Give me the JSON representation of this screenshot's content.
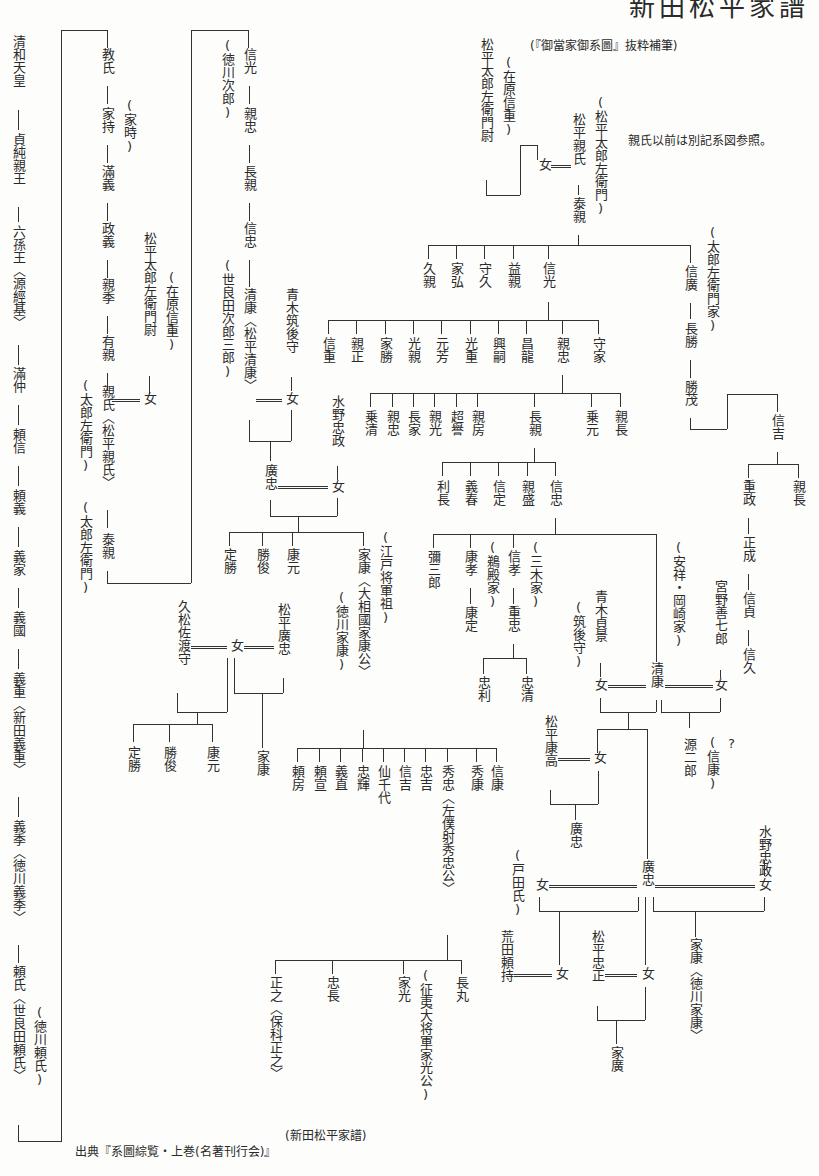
{
  "title": "新田松平家譜",
  "subtitle": "(『御當家御系圖』抜粋補筆)",
  "note": "親氏以前は別記系図参照。",
  "source": "出典『系圖綜覧・上巻(名著刊行会)』",
  "caption": "(新田松平家譜)",
  "col1": {
    "a": "清和天皇",
    "b": "貞純親王",
    "c": "六孫王〈源經基〉",
    "d": "滿仲",
    "e": "頼信",
    "f": "頼義",
    "g": "義家",
    "h": "義國",
    "i": "義重〈新田義重〉",
    "j": "義季〈徳川義季〉",
    "k": "頼氏〈世良田頼氏〉",
    "k_note": "(徳川頼氏)"
  },
  "col2": {
    "a": "教氏",
    "a_note": "(家時)",
    "b": "家持",
    "c": "滿義",
    "d": "政義",
    "e": "親季",
    "f": "有親",
    "g": "親氏〈松平親氏〉",
    "g_note1": "(太郎左衛門)",
    "g_note2": "(太郎左衛門)",
    "h": "泰親",
    "wife_father": "松平太郎左衛門尉",
    "wife_father_note": "(在原信重)",
    "wife": "女"
  },
  "col3": {
    "a": "信光",
    "a_note": "(徳川次郎)",
    "b": "親忠",
    "c": "長親",
    "d": "信忠",
    "e": "清康〈松平清康〉",
    "e_note": "(世良田次郎三郎)",
    "aoki": "青木筑後守",
    "aoki_daughter": "女",
    "hirotada": "廣忠",
    "mizuno": "水野忠政",
    "mizuno_daughter": "女",
    "children": [
      "定勝",
      "勝俊",
      "康元"
    ],
    "ieyasu": "家康〈大相國家康公〉",
    "ieyasu_note1": "(江戸将軍祖)",
    "ieyasu_note2": "(徳川家康)"
  },
  "top": {
    "mat_father": "松平太郎左衛門尉",
    "mat_father_note": "(在原信重)",
    "wife": "女",
    "chikauji": "松平親氏",
    "chikauji_note": "(松平太郎左衛門)",
    "yasuchika": "泰親",
    "sons": [
      "久親",
      "家弘",
      "守久",
      "益親",
      "信光"
    ],
    "nobuhiro": "信廣",
    "nobuhiro_note": "(太郎左衛門家)",
    "nagakatsu": "長勝",
    "katsushige": "勝茂",
    "nobuyoshi": "信吉",
    "shigemasa": "重政",
    "chikanaga2": "親長",
    "masanari": "正成",
    "nobusada": "信貞",
    "nobuhisa": "信久"
  },
  "nobumitsu_sons": [
    "信重",
    "親正",
    "家勝",
    "光親",
    "元芳",
    "光重",
    "興嗣",
    "昌龍",
    "親忠",
    "守家"
  ],
  "chikatada_sons": [
    "乗清",
    "親忠",
    "長家",
    "親光",
    "超譽",
    "親房",
    "長親",
    "乗元",
    "親長"
  ],
  "nagachika_sons": [
    "利長",
    "義春",
    "信定",
    "親盛",
    "信忠"
  ],
  "nobutada_sons": {
    "yasaburo": "彌三郎",
    "yasutaka": "康孝",
    "yasusada": "康定",
    "udono": "(鵜殿家)",
    "nobutaka": "信孝",
    "shigetada": "重忠",
    "miki": "(三木家)",
    "tadatoshi": "忠利",
    "tadakiyo": "忠清"
  },
  "kiyoyasu_block": {
    "aoki_sadakage": "青木貞景",
    "aoki_note": "(筑後守)",
    "wife1": "女",
    "kiyoyasu": "清康",
    "anjo_note": "(安祥・岡崎家)",
    "miyano": "宮野善七郎",
    "wife2": "女",
    "genjiro": "源二郎",
    "genjiro_note": "(信康)",
    "question": "?",
    "yasutaka": "松平康高",
    "daughter": "女",
    "hirotada_small": "廣忠",
    "hirotada": "廣忠",
    "toda_note": "(戸田氏)",
    "toda_wife": "女",
    "mizuno": "水野忠政",
    "mizuno_wife": "女",
    "ieyasu2": "家康〈徳川家康〉",
    "arata": "荒田頼持",
    "arata_wife": "女",
    "tadamasa": "松平忠正",
    "tadamasa_wife": "女",
    "iehiro": "家廣"
  },
  "hisamatsu_block": {
    "hisamatsu": "久松佐渡守",
    "wife": "女",
    "hirotada": "松平廣忠",
    "children": [
      "定勝",
      "勝俊",
      "康元"
    ],
    "ieyasu": "家康"
  },
  "ieyasu_sons": [
    "頼房",
    "頼宣",
    "義直",
    "忠輝",
    "仙千代",
    "信吉",
    "忠吉",
    "秀忠〈左僕射秀忠公〉",
    "秀康",
    "信康"
  ],
  "hidetada_sons": {
    "masayuki": "正之〈保科正之〉",
    "tadanaga": "忠長",
    "iemitsu": "家光",
    "iemitsu_note": "(征夷大将軍家光公)",
    "nagamaru": "長丸"
  }
}
